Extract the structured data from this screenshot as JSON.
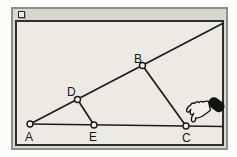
{
  "window": {
    "titlebar": {
      "close_box_icon": "close-box"
    }
  },
  "figure": {
    "background_color": "#edeae4",
    "line_color": "#1c1c1a",
    "point_fill_color": "#f2f0ec",
    "points": [
      {
        "label": "A",
        "x": 30,
        "y": 124,
        "label_x": 25,
        "label_y": 141
      },
      {
        "label": "E",
        "x": 94,
        "y": 125,
        "label_x": 89,
        "label_y": 141
      },
      {
        "label": "C",
        "x": 186,
        "y": 126,
        "label_x": 182,
        "label_y": 142
      },
      {
        "label": "D",
        "x": 77.5,
        "y": 99.5,
        "label_x": 67,
        "label_y": 96
      },
      {
        "label": "B",
        "x": 142.5,
        "y": 65.5,
        "label_x": 134,
        "label_y": 63
      }
    ],
    "lines": [
      {
        "name": "ray-A-D-B",
        "x1": 30,
        "y1": 124,
        "x2": 223.5,
        "y2": 23
      },
      {
        "name": "line-A-E-C",
        "x1": 30,
        "y1": 124,
        "x2": 223.5,
        "y2": 126.5
      },
      {
        "name": "segment-D-E",
        "x1": 77.5,
        "y1": 99.5,
        "x2": 94,
        "y2": 125
      },
      {
        "name": "segment-B-C",
        "x1": 142.5,
        "y1": 65.5,
        "x2": 186,
        "y2": 126
      }
    ]
  },
  "cursor": {
    "icon": "drag-hand",
    "grabbing_point": "C"
  }
}
